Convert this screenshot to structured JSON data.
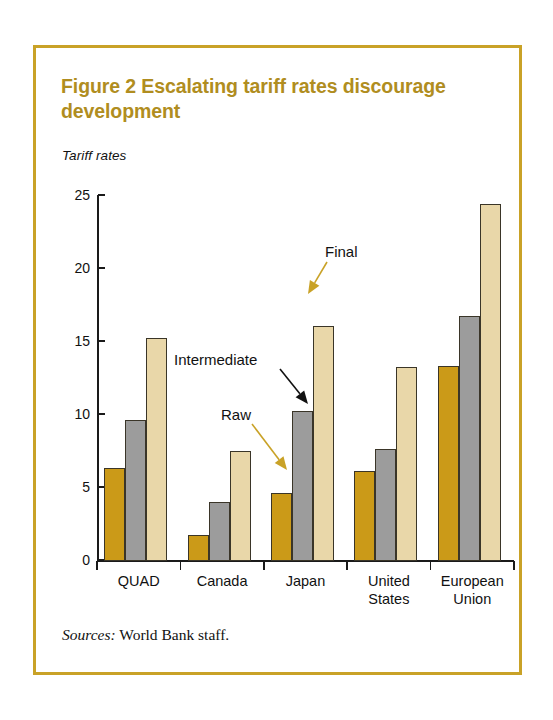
{
  "figure": {
    "title": "Figure 2  Escalating tariff rates discourage development",
    "axis_unit_label": "Tariff rates",
    "source_lead": "Sources:",
    "source_text": " World Bank staff.",
    "frame_color": "#c9a227",
    "title_color": "#b08d20"
  },
  "annotations": [
    {
      "id": "raw",
      "label": "Raw",
      "arrow_color": "#c9a227"
    },
    {
      "id": "intermediate",
      "label": "Intermediate",
      "arrow_color": "#111111"
    },
    {
      "id": "final",
      "label": "Final",
      "arrow_color": "#c9a227"
    }
  ],
  "chart_data": {
    "type": "bar",
    "title": "Figure 2  Escalating tariff rates discourage development",
    "subtitle": "Tariff rates",
    "xlabel": "",
    "ylabel": "Tariff rates",
    "ylim": [
      0,
      25
    ],
    "yticks": [
      0,
      5,
      10,
      15,
      20,
      25
    ],
    "ytick_labels": [
      "0",
      "5",
      "10",
      "15",
      "20",
      "25"
    ],
    "grid": false,
    "legend_position": "annotated-arrows",
    "categories": [
      "QUAD",
      "Canada",
      "Japan",
      "United States",
      "European Union"
    ],
    "category_labels_multiline": [
      [
        "QUAD"
      ],
      [
        "Canada"
      ],
      [
        "Japan"
      ],
      [
        "United",
        "States"
      ],
      [
        "European",
        "Union"
      ]
    ],
    "series": [
      {
        "name": "Raw",
        "color": "#cb9a18",
        "values": [
          6.3,
          1.7,
          4.6,
          6.1,
          13.3
        ]
      },
      {
        "name": "Intermediate",
        "color": "#9c9c9c",
        "values": [
          9.6,
          4.0,
          10.2,
          7.6,
          16.7
        ]
      },
      {
        "name": "Final",
        "color": "#e9d7a9",
        "values": [
          15.2,
          7.5,
          16.0,
          13.2,
          24.4
        ]
      }
    ],
    "annotations": [
      {
        "text": "Raw",
        "points_to": "Japan / Raw bar"
      },
      {
        "text": "Intermediate",
        "points_to": "Japan / Intermediate bar"
      },
      {
        "text": "Final",
        "points_to": "Japan / Final bar"
      }
    ],
    "source": "Sources: World Bank staff."
  }
}
